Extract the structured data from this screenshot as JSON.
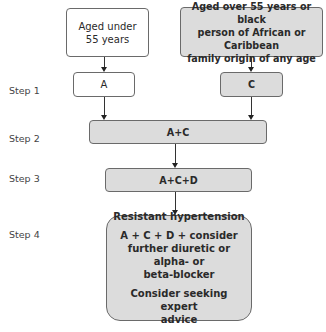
{
  "diagram": {
    "start_left": "Aged under 55 years",
    "start_left_lines": [
      "Aged under",
      "55 years"
    ],
    "start_right_lines": [
      "Aged over 55 years or black",
      "person of African or Caribbean",
      "family origin of any age"
    ],
    "steps": [
      {
        "label": "Step 1"
      },
      {
        "label": "Step 2"
      },
      {
        "label": "Step 3"
      },
      {
        "label": "Step 4"
      }
    ],
    "step1_left": "A",
    "step1_right": "C",
    "step2": "A+C",
    "step3": "A+C+D",
    "step4": {
      "title": "Resistant hypertension",
      "treatment_lines": [
        "A + C + D + consider",
        "further diuretic or alpha- or",
        "beta-blocker"
      ],
      "advice_lines": [
        "Consider seeking expert",
        "advice"
      ]
    }
  }
}
